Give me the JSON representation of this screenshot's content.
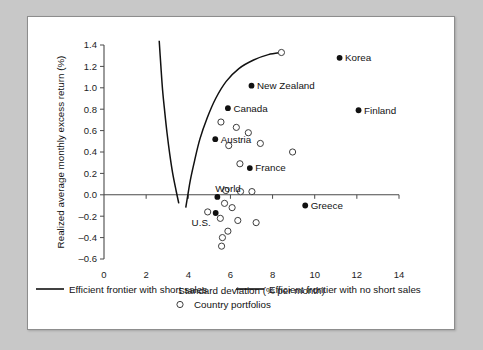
{
  "figure": {
    "background_color": "#c8c8c8",
    "panel_color": "#ffffff",
    "panel_border_color": "#8d8d8d"
  },
  "chart_data": {
    "type": "scatter",
    "title": "",
    "xlabel": "Standard deviation (% per month)",
    "ylabel": "Realized average monthly excess return (%)",
    "xlim": [
      0,
      14
    ],
    "ylim": [
      -0.6,
      1.4
    ],
    "xticks": [
      0,
      2,
      4,
      6,
      8,
      10,
      12,
      14
    ],
    "xticklabels": [
      "0",
      "2",
      "4",
      "6",
      "8",
      "10",
      "12",
      "14"
    ],
    "yticks": [
      -0.6,
      -0.4,
      -0.2,
      0.0,
      0.2,
      0.4,
      0.6,
      0.8,
      1.0,
      1.2,
      1.4
    ],
    "yticklabels": [
      "-0.6",
      "-0.4",
      "-0.2",
      "0.0",
      "0.2",
      "0.4",
      "0.6",
      "0.8",
      "1.0",
      "1.2",
      "1.4"
    ],
    "grid": false,
    "legend_position": "below",
    "series": [
      {
        "name": "Efficient frontier with short sales",
        "type": "line",
        "marker": "none",
        "color": "#111111",
        "points": [
          [
            2.62,
            1.44
          ],
          [
            2.7,
            1.2
          ],
          [
            2.78,
            0.98
          ],
          [
            2.88,
            0.78
          ],
          [
            2.99,
            0.58
          ],
          [
            3.12,
            0.38
          ],
          [
            3.26,
            0.2
          ],
          [
            3.42,
            0.04
          ],
          [
            3.55,
            -0.08
          ]
        ]
      },
      {
        "name": "Efficient frontier with no short sales",
        "type": "line",
        "marker": "none",
        "color": "#111111",
        "points": [
          [
            8.42,
            1.33
          ],
          [
            7.8,
            1.31
          ],
          [
            7.1,
            1.26
          ],
          [
            6.4,
            1.18
          ],
          [
            5.8,
            1.06
          ],
          [
            5.3,
            0.9
          ],
          [
            4.9,
            0.72
          ],
          [
            4.55,
            0.52
          ],
          [
            4.3,
            0.32
          ],
          [
            4.1,
            0.14
          ],
          [
            3.98,
            0.0
          ],
          [
            3.88,
            -0.12
          ]
        ]
      },
      {
        "name": "Country portfolios",
        "type": "scatter",
        "marker": "open-circle",
        "color": "#3d3d3d",
        "points": [
          [
            8.42,
            1.33
          ],
          [
            5.55,
            0.68
          ],
          [
            6.28,
            0.63
          ],
          [
            6.85,
            0.58
          ],
          [
            7.42,
            0.48
          ],
          [
            8.95,
            0.4
          ],
          [
            5.92,
            0.46
          ],
          [
            6.45,
            0.29
          ],
          [
            5.78,
            0.04
          ],
          [
            6.48,
            0.03
          ],
          [
            7.02,
            0.03
          ],
          [
            5.72,
            -0.08
          ],
          [
            6.08,
            -0.12
          ],
          [
            4.92,
            -0.16
          ],
          [
            5.52,
            -0.22
          ],
          [
            6.35,
            -0.24
          ],
          [
            7.22,
            -0.26
          ],
          [
            5.88,
            -0.34
          ],
          [
            5.62,
            -0.4
          ],
          [
            5.58,
            -0.48
          ]
        ]
      },
      {
        "name": "Individual countries",
        "type": "scatter",
        "marker": "filled-circle",
        "color": "#111111",
        "points": [
          {
            "label": "Korea",
            "x": 11.18,
            "y": 1.28,
            "label_pos": "right"
          },
          {
            "label": "New Zealand",
            "x": 7.0,
            "y": 1.02,
            "label_pos": "right"
          },
          {
            "label": "Canada",
            "x": 5.88,
            "y": 0.81,
            "label_pos": "right"
          },
          {
            "label": "Finland",
            "x": 12.08,
            "y": 0.79,
            "label_pos": "right"
          },
          {
            "label": "Austria",
            "x": 5.28,
            "y": 0.52,
            "label_pos": "right"
          },
          {
            "label": "France",
            "x": 6.92,
            "y": 0.25,
            "label_pos": "right"
          },
          {
            "label": "World",
            "x": 5.38,
            "y": -0.02,
            "label_pos": "above-right"
          },
          {
            "label": "Greece",
            "x": 9.55,
            "y": -0.1,
            "label_pos": "right"
          },
          {
            "label": "U.S.",
            "x": 5.3,
            "y": -0.17,
            "label_pos": "below-left"
          }
        ]
      }
    ]
  },
  "legend": {
    "items": [
      {
        "label": "Efficient frontier with short sales",
        "marker": "line"
      },
      {
        "label": "Efficient frontier with no short sales",
        "marker": "line"
      },
      {
        "label": "Country portfolios",
        "marker": "open-circle"
      }
    ]
  }
}
